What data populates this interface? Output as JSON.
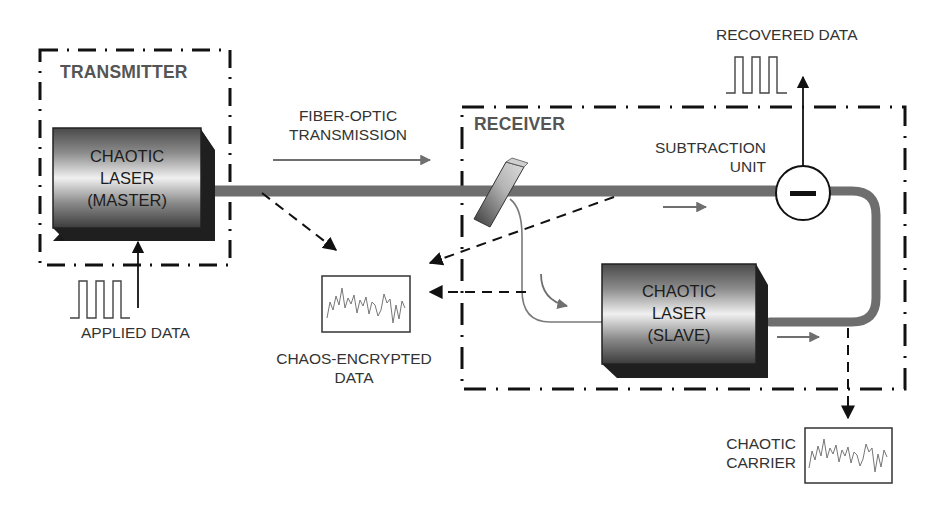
{
  "transmitter": {
    "title": "TRANSMITTER",
    "laser": {
      "line1": "CHAOTIC",
      "line2": "LASER",
      "line3": "(MASTER)"
    },
    "input_label": "APPLIED DATA"
  },
  "link": {
    "label_line1": "FIBER-OPTIC",
    "label_line2": "TRANSMISSION"
  },
  "receiver": {
    "title": "RECEIVER",
    "subtraction": {
      "line1": "SUBTRACTION",
      "line2": "UNIT",
      "symbol": "−"
    },
    "laser": {
      "line1": "CHAOTIC",
      "line2": "LASER",
      "line3": "(SLAVE)"
    },
    "output_label": "RECOVERED DATA"
  },
  "signals": {
    "encrypted": {
      "line1": "CHAOS-ENCRYPTED",
      "line2": "DATA"
    },
    "carrier": {
      "line1": "CHAOTIC",
      "line2": "CARRIER"
    }
  },
  "colors": {
    "fiber": "#6e6e6e",
    "thin_fiber": "#7a7a7a",
    "frame": "#111111",
    "text": "#333333",
    "title_text": "#555555",
    "laser_dark": "#3a3a3a",
    "laser_light": "#f2f2f2",
    "laser_shadow": "#1a1a1a"
  }
}
